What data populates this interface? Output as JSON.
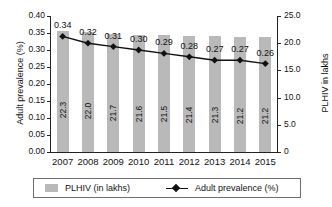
{
  "chart_data": {
    "type": "bar",
    "title": "",
    "subtitle": "",
    "xlabel": "",
    "ylabel": "Adult prevalence (%)",
    "y2label": "PLHIV in lakhs",
    "categories": [
      "2007",
      "2008",
      "2009",
      "2010",
      "2011",
      "2012",
      "2013",
      "2014",
      "2015"
    ],
    "grid": false,
    "legend_position": "bottom",
    "ylim": [
      0.0,
      0.4
    ],
    "y2lim": [
      0,
      25.0
    ],
    "yticks": [
      "0.00",
      "0.05",
      "0.10",
      "0.15",
      "0.20",
      "0.25",
      "0.30",
      "0.35",
      "0.40"
    ],
    "ytick_values": [
      0.0,
      0.05,
      0.1,
      0.15,
      0.2,
      0.25,
      0.3,
      0.35,
      0.4
    ],
    "y2ticks": [
      "0",
      "5.0",
      "10.0",
      "15.0",
      "20.0",
      "25.0"
    ],
    "y2tick_values": [
      0,
      5.0,
      10.0,
      15.0,
      20.0,
      25.0
    ],
    "series": [
      {
        "name": "PLHIV (in lakhs)",
        "type": "bar",
        "axis": "right",
        "color": "#b9b9b9",
        "values": [
          22.3,
          22.0,
          21.7,
          21.6,
          21.5,
          21.4,
          21.3,
          21.2,
          21.2
        ],
        "labels": [
          "22.3",
          "22.0",
          "21.7",
          "21.6",
          "21.5",
          "21.4",
          "21.3",
          "21.2",
          "21.2"
        ]
      },
      {
        "name": "Adult prevalence (%)",
        "type": "line",
        "axis": "left",
        "color": "#111111",
        "marker": "diamond",
        "values": [
          0.34,
          0.32,
          0.31,
          0.3,
          0.29,
          0.28,
          0.27,
          0.27,
          0.26
        ],
        "labels": [
          "0.34",
          "0.32",
          "0.31",
          "0.30",
          "0.29",
          "0.28",
          "0.27",
          "0.27",
          "0.26"
        ]
      }
    ]
  },
  "legend": {
    "bar_label": "PLHIV (in lakhs)",
    "line_label": "Adult prevalence (%)"
  }
}
